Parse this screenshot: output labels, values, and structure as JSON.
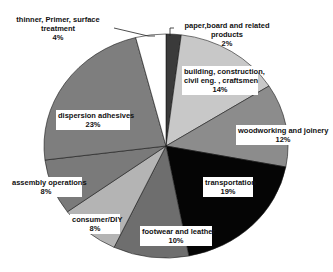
{
  "chart_data": {
    "type": "pie",
    "title": "",
    "start_angle_deg": 0,
    "direction": "clockwise",
    "slices": [
      {
        "label": "paper,board and related products",
        "value": 2,
        "pct_label": "2%",
        "color": "#3a3a3a"
      },
      {
        "label": "building, construction, civil eng. , craftsmen",
        "value": 14,
        "pct_label": "14%",
        "color": "#c8c8c8"
      },
      {
        "label": "woodworking and joinery",
        "value": 12,
        "pct_label": "12%",
        "color": "#8c8c8c"
      },
      {
        "label": "transportation",
        "value": 19,
        "pct_label": "19%",
        "color": "#050505"
      },
      {
        "label": "footwear and leather",
        "value": 10,
        "pct_label": "10%",
        "color": "#6e6e6e"
      },
      {
        "label": "consumer/DIY",
        "value": 8,
        "pct_label": "8%",
        "color": "#b4b4b4"
      },
      {
        "label": "assembly operations",
        "value": 8,
        "pct_label": "8%",
        "color": "#7a7a7a"
      },
      {
        "label": "dispersion adhesives",
        "value": 23,
        "pct_label": "23%",
        "color": "#7e7e7e"
      },
      {
        "label": "thinner, Primer, surface treatment",
        "value": 4,
        "pct_label": "4%",
        "color": "#ffffff"
      }
    ],
    "categories": [
      "paper,board and related products",
      "building, construction, civil eng. , craftsmen",
      "woodworking and joinery",
      "transportation",
      "footwear and leather",
      "consumer/DIY",
      "assembly operations",
      "dispersion adhesives",
      "thinner, Primer, surface treatment"
    ],
    "values": [
      2,
      14,
      12,
      19,
      10,
      8,
      8,
      23,
      4
    ],
    "units": "%",
    "legend": "none (data labels on slices)"
  },
  "labels": {
    "paper": {
      "line1": "paper,board and related",
      "line2": "products",
      "pct": "2%"
    },
    "building": {
      "line1": "building, construction,",
      "line2": "civil eng. , craftsmen",
      "pct": "14%"
    },
    "wood": {
      "line1": "woodworking and joinery",
      "pct": "12%"
    },
    "transport": {
      "line1": "transportation",
      "pct": "19%"
    },
    "footwear": {
      "line1": "footwear and leather",
      "pct": "10%"
    },
    "consumer": {
      "line1": "consumer/DIY",
      "pct": "8%"
    },
    "assembly": {
      "line1": "assembly operations",
      "pct": "8%"
    },
    "dispersion": {
      "line1": "dispersion adhesives",
      "pct": "23%"
    },
    "thinner": {
      "line1": "thinner, Primer, surface",
      "line2": "treatment",
      "pct": "4%"
    }
  }
}
